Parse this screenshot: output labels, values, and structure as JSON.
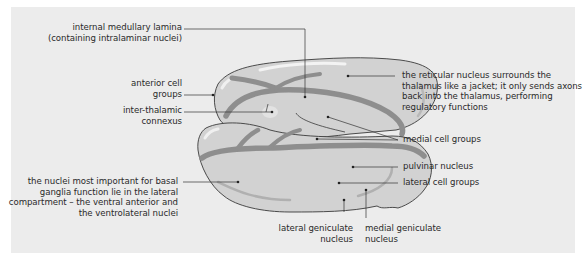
{
  "diagram": {
    "subject": "thalamus",
    "colors": {
      "background": "#ffffff",
      "panel": "#ececec",
      "body_fill": "#d2d2d2",
      "lamina": "#8e8e8e",
      "outline": "#3a3a3a",
      "leader_line": "#333333",
      "text": "#2a2a2a"
    },
    "labels": {
      "internal_medullary_lamina": [
        "internal medullary lamina",
        "(containing intralaminar nuclei)"
      ],
      "anterior_cell_groups": [
        "anterior cell",
        "groups"
      ],
      "inter_thalamic_connexus": [
        "inter-thalamic",
        "connexus"
      ],
      "basal_ganglia_nuclei": [
        "the nuclei most important for basal",
        "ganglia function lie in the lateral",
        "compartment – the ventral anterior and",
        "the ventrolateral nuclei"
      ],
      "reticular_nucleus": [
        "the reticular nucleus surrounds the",
        "thalamus like a jacket; it only sends axons",
        "back into the thalamus, performing",
        "regulatory functions"
      ],
      "medial_cell_groups": [
        "medial cell groups"
      ],
      "pulvinar_nucleus": [
        "pulvinar nucleus"
      ],
      "lateral_cell_groups": [
        "lateral cell groups"
      ],
      "lateral_geniculate_nucleus": [
        "lateral geniculate",
        "nucleus"
      ],
      "medial_geniculate_nucleus": [
        "medial geniculate",
        "nucleus"
      ]
    }
  }
}
